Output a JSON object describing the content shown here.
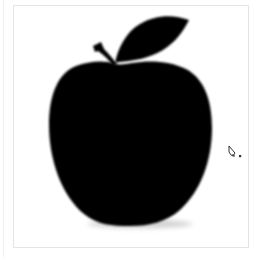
{
  "canvas": {
    "background": "#ffffff",
    "frame_border_color": "#e4e4e4",
    "artwork": {
      "subject": "apple-silhouette",
      "fill": "#000000",
      "shadow": "#d6d6d6",
      "parts": [
        "apple-body",
        "stem",
        "leaf"
      ]
    }
  },
  "cursor": {
    "icon": "pen-tool-icon",
    "color": "#333333"
  }
}
